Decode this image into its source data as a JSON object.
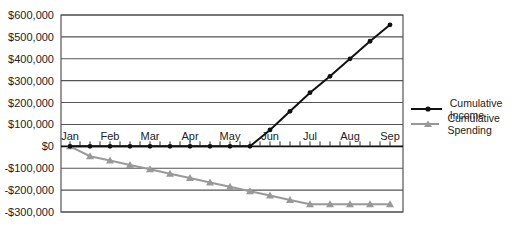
{
  "chart_data": {
    "type": "line",
    "title": "",
    "xlabel": "",
    "ylabel": "",
    "ylim": [
      -300000,
      600000
    ],
    "yticks": [
      600000,
      500000,
      400000,
      300000,
      200000,
      100000,
      0,
      -100000,
      -200000,
      -300000
    ],
    "ytick_labels": [
      "$600,000",
      "$500,000",
      "$400,000",
      "$300,000",
      "$200,000",
      "$100,000",
      "$0",
      "-$100,000",
      "-$200,000",
      "-$300,000"
    ],
    "xtick_labels": [
      "Jan",
      "Feb",
      "Mar",
      "Apr",
      "May",
      "Jun",
      "Jul",
      "Aug",
      "Sep"
    ],
    "points_per_month": 2,
    "grid": true,
    "legend_position": "right",
    "series": [
      {
        "name": "Cumulative Income",
        "color": "#111111",
        "marker": "circle",
        "values": [
          0,
          0,
          0,
          0,
          0,
          0,
          0,
          0,
          0,
          0,
          75000,
          160000,
          245000,
          320000,
          400000,
          480000,
          555000
        ]
      },
      {
        "name": "Cumulative Spending",
        "color": "#999999",
        "marker": "triangle",
        "values": [
          0,
          -45000,
          -65000,
          -85000,
          -105000,
          -125000,
          -145000,
          -165000,
          -185000,
          -205000,
          -225000,
          -245000,
          -265000,
          -265000,
          -265000,
          -265000,
          -265000
        ]
      }
    ]
  },
  "legend": {
    "items": [
      {
        "label": "Cumulative Income"
      },
      {
        "label": "Cumulative Spending"
      }
    ]
  }
}
